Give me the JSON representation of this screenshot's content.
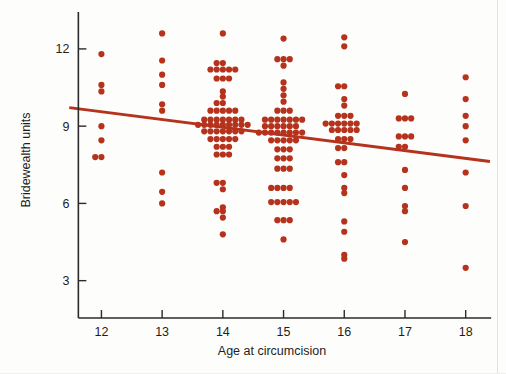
{
  "figure": {
    "name": "scatter-figure",
    "background_color": "#fdfdfc"
  },
  "chart_data": {
    "type": "scatter",
    "title": "",
    "xlabel": "Age at circumcision",
    "ylabel": "Bridewealth units",
    "xlim": [
      11.4,
      18.45
    ],
    "ylim": [
      1.55,
      13.2
    ],
    "xticks": [
      12,
      13,
      14,
      15,
      16,
      17,
      18
    ],
    "xtick_labels": [
      "12",
      "13",
      "14",
      "15",
      "16",
      "17",
      "18"
    ],
    "yticks": [
      3,
      6,
      9,
      12
    ],
    "ytick_labels": [
      "3",
      "6",
      "9",
      "12"
    ],
    "grid": false,
    "legend": null,
    "marker_color": "#b5321c",
    "marker_radius": 3.1,
    "jitter": "horizontal stripchart, points stacked symmetrically about each integer age",
    "series": [
      {
        "name": "Bridewealth units by age at circumcision",
        "points": [
          [
            12,
            11.8
          ],
          [
            12,
            10.6
          ],
          [
            12,
            10.35
          ],
          [
            12,
            9.0
          ],
          [
            12,
            8.45
          ],
          [
            12,
            7.8
          ],
          [
            12,
            7.8
          ],
          [
            13,
            12.6
          ],
          [
            13,
            11.55
          ],
          [
            13,
            11.0
          ],
          [
            13,
            10.6
          ],
          [
            13,
            9.85
          ],
          [
            13,
            9.6
          ],
          [
            13,
            7.2
          ],
          [
            13,
            6.45
          ],
          [
            13,
            6.0
          ],
          [
            14,
            12.6
          ],
          [
            14,
            11.45
          ],
          [
            14,
            11.45
          ],
          [
            14,
            11.2
          ],
          [
            14,
            11.2
          ],
          [
            14,
            11.2
          ],
          [
            14,
            11.2
          ],
          [
            14,
            11.2
          ],
          [
            14,
            10.85
          ],
          [
            14,
            10.85
          ],
          [
            14,
            10.85
          ],
          [
            14,
            10.35
          ],
          [
            14,
            10.15
          ],
          [
            14,
            9.9
          ],
          [
            14,
            9.9
          ],
          [
            14,
            9.6
          ],
          [
            14,
            9.6
          ],
          [
            14,
            9.6
          ],
          [
            14,
            9.6
          ],
          [
            14,
            9.6
          ],
          [
            14,
            9.25
          ],
          [
            14,
            9.25
          ],
          [
            14,
            9.25
          ],
          [
            14,
            9.25
          ],
          [
            14,
            9.25
          ],
          [
            14,
            9.25
          ],
          [
            14,
            9.25
          ],
          [
            14,
            9.05
          ],
          [
            14,
            9.05
          ],
          [
            14,
            9.05
          ],
          [
            14,
            9.05
          ],
          [
            14,
            9.05
          ],
          [
            14,
            9.05
          ],
          [
            14,
            9.05
          ],
          [
            14,
            9.05
          ],
          [
            14,
            9.05
          ],
          [
            14,
            8.8
          ],
          [
            14,
            8.8
          ],
          [
            14,
            8.8
          ],
          [
            14,
            8.8
          ],
          [
            14,
            8.8
          ],
          [
            14,
            8.8
          ],
          [
            14,
            8.8
          ],
          [
            14,
            8.5
          ],
          [
            14,
            8.5
          ],
          [
            14,
            8.5
          ],
          [
            14,
            8.5
          ],
          [
            14,
            8.5
          ],
          [
            14,
            8.2
          ],
          [
            14,
            8.2
          ],
          [
            14,
            8.2
          ],
          [
            14,
            7.9
          ],
          [
            14,
            7.9
          ],
          [
            14,
            7.9
          ],
          [
            14,
            6.8
          ],
          [
            14,
            6.8
          ],
          [
            14,
            6.55
          ],
          [
            14,
            5.85
          ],
          [
            14,
            5.7
          ],
          [
            14,
            5.7
          ],
          [
            14,
            5.45
          ],
          [
            14,
            4.8
          ],
          [
            15,
            12.4
          ],
          [
            15,
            11.6
          ],
          [
            15,
            11.6
          ],
          [
            15,
            11.6
          ],
          [
            15,
            11.35
          ],
          [
            15,
            10.7
          ],
          [
            15,
            10.45
          ],
          [
            15,
            10.2
          ],
          [
            15,
            9.95
          ],
          [
            15,
            9.6
          ],
          [
            15,
            9.6
          ],
          [
            15,
            9.6
          ],
          [
            15,
            9.25
          ],
          [
            15,
            9.25
          ],
          [
            15,
            9.25
          ],
          [
            15,
            9.25
          ],
          [
            15,
            9.25
          ],
          [
            15,
            9.25
          ],
          [
            15,
            9.25
          ],
          [
            15,
            9.0
          ],
          [
            15,
            9.0
          ],
          [
            15,
            9.0
          ],
          [
            15,
            9.0
          ],
          [
            15,
            9.0
          ],
          [
            15,
            9.0
          ],
          [
            15,
            8.75
          ],
          [
            15,
            8.75
          ],
          [
            15,
            8.75
          ],
          [
            15,
            8.75
          ],
          [
            15,
            8.75
          ],
          [
            15,
            8.75
          ],
          [
            15,
            8.75
          ],
          [
            15,
            8.75
          ],
          [
            15,
            8.45
          ],
          [
            15,
            8.45
          ],
          [
            15,
            8.45
          ],
          [
            15,
            8.45
          ],
          [
            15,
            8.45
          ],
          [
            15,
            8.1
          ],
          [
            15,
            8.1
          ],
          [
            15,
            8.1
          ],
          [
            15,
            7.75
          ],
          [
            15,
            7.75
          ],
          [
            15,
            7.75
          ],
          [
            15,
            7.35
          ],
          [
            15,
            7.35
          ],
          [
            15,
            7.35
          ],
          [
            15,
            6.6
          ],
          [
            15,
            6.6
          ],
          [
            15,
            6.6
          ],
          [
            15,
            6.6
          ],
          [
            15,
            6.05
          ],
          [
            15,
            6.05
          ],
          [
            15,
            6.05
          ],
          [
            15,
            6.05
          ],
          [
            15,
            6.05
          ],
          [
            15,
            5.35
          ],
          [
            15,
            5.35
          ],
          [
            15,
            5.35
          ],
          [
            15,
            4.6
          ],
          [
            16,
            12.45
          ],
          [
            16,
            12.1
          ],
          [
            16,
            10.55
          ],
          [
            16,
            10.55
          ],
          [
            16,
            10.05
          ],
          [
            16,
            9.8
          ],
          [
            16,
            9.4
          ],
          [
            16,
            9.4
          ],
          [
            16,
            9.4
          ],
          [
            16,
            9.1
          ],
          [
            16,
            9.1
          ],
          [
            16,
            9.1
          ],
          [
            16,
            9.1
          ],
          [
            16,
            9.1
          ],
          [
            16,
            9.1
          ],
          [
            16,
            8.85
          ],
          [
            16,
            8.85
          ],
          [
            16,
            8.85
          ],
          [
            16,
            8.85
          ],
          [
            16,
            8.85
          ],
          [
            16,
            8.5
          ],
          [
            16,
            8.5
          ],
          [
            16,
            8.5
          ],
          [
            16,
            8.15
          ],
          [
            16,
            8.15
          ],
          [
            16,
            7.6
          ],
          [
            16,
            7.6
          ],
          [
            16,
            7.1
          ],
          [
            16,
            6.6
          ],
          [
            16,
            6.4
          ],
          [
            16,
            5.3
          ],
          [
            16,
            4.9
          ],
          [
            16,
            4.0
          ],
          [
            16,
            3.85
          ],
          [
            17,
            10.25
          ],
          [
            17,
            9.3
          ],
          [
            17,
            9.3
          ],
          [
            17,
            9.3
          ],
          [
            17,
            8.6
          ],
          [
            17,
            8.6
          ],
          [
            17,
            8.6
          ],
          [
            17,
            8.2
          ],
          [
            17,
            8.2
          ],
          [
            17,
            7.3
          ],
          [
            17,
            6.6
          ],
          [
            17,
            5.9
          ],
          [
            17,
            5.7
          ],
          [
            17,
            4.5
          ],
          [
            18,
            10.9
          ],
          [
            18,
            10.05
          ],
          [
            18,
            9.4
          ],
          [
            18,
            9.0
          ],
          [
            18,
            8.45
          ],
          [
            18,
            7.2
          ],
          [
            18,
            5.9
          ],
          [
            18,
            3.5
          ]
        ]
      }
    ],
    "fit_line": {
      "name": "least-squares regression line",
      "color": "#b5321c",
      "width": 3.0,
      "x_start": 11.47,
      "y_start": 9.72,
      "x_end": 18.4,
      "y_end": 7.63
    }
  }
}
